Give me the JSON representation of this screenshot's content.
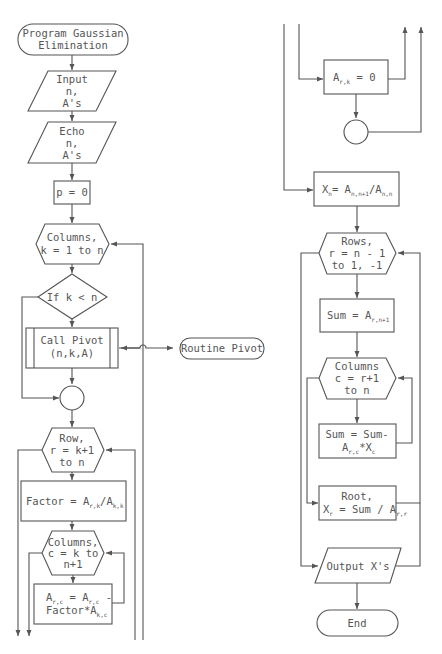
{
  "diagram": {
    "type": "flowchart",
    "title": "Program Gaussian Elimination",
    "colors": {
      "stroke": "#555555",
      "text": "#555555",
      "background": "#ffffff"
    },
    "left_column": {
      "start": {
        "line1": "Program Gaussian",
        "line2": "Elimination"
      },
      "input": {
        "line1": "Input",
        "line2": "n,",
        "line3": "A's"
      },
      "echo": {
        "line1": "Echo",
        "line2": "n,",
        "line3": "A's"
      },
      "init": {
        "text": "p = 0"
      },
      "loop_k": {
        "line1": "Columns,",
        "line2": "k = 1 to n"
      },
      "decision": {
        "text": "If k < n"
      },
      "call_pivot": {
        "line1": "Call Pivot",
        "line2": "(n,k,A)"
      },
      "routine_pivot": {
        "text": "Routine Pivot"
      },
      "loop_r": {
        "line1": "Row,",
        "line2": "r = k+1",
        "line3": "to n"
      },
      "factor": {
        "main": "Factor = A",
        "sub1": "r,k",
        "mid": "/A",
        "sub2": "k,k"
      },
      "loop_c": {
        "line1": "Columns,",
        "line2": "c = k to",
        "line3": "n+1"
      },
      "update": {
        "l1a": "A",
        "l1s1": "r,c",
        "l1b": " = A",
        "l1s2": "r,c",
        "l1c": " -",
        "l2a": "Factor*A",
        "l2s": "k,c"
      }
    },
    "right_column": {
      "zero": {
        "a": "A",
        "sub": "r,k",
        "b": " = 0"
      },
      "xn": {
        "a": "X",
        "s1": "n",
        "b": "= A",
        "s2": "n,n+1",
        "c": "/A",
        "s3": "n,n"
      },
      "loop_rows": {
        "line1": "Rows,",
        "line2": "r = n - 1",
        "line3": "to 1, -1"
      },
      "sum_init": {
        "a": "Sum = A",
        "sub": "r,n+1"
      },
      "loop_cols": {
        "line1": "Columns",
        "line2": "c = r+1",
        "line3": "to n"
      },
      "sum_update": {
        "line1": "Sum = Sum-",
        "a": "A",
        "s1": "r,c",
        "b": "*X",
        "s2": "c"
      },
      "root": {
        "line1": "Root,",
        "a": "X",
        "s1": "r",
        "b": " = Sum / A",
        "s2": "r,r"
      },
      "output": {
        "text": "Output X's"
      },
      "end": {
        "text": "End"
      }
    }
  }
}
